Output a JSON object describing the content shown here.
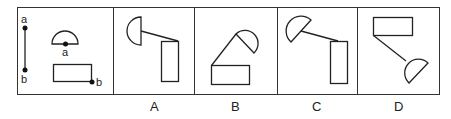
{
  "puzzle": {
    "question_panel": {
      "labels": {
        "segment_top": "a",
        "segment_bottom": "b",
        "semicircle_point": "a",
        "rectangle_point": "b"
      }
    },
    "options": [
      {
        "label": "A"
      },
      {
        "label": "B"
      },
      {
        "label": "C"
      },
      {
        "label": "D"
      }
    ],
    "colors": {
      "stroke": "#222222",
      "background": "#ffffff"
    }
  }
}
